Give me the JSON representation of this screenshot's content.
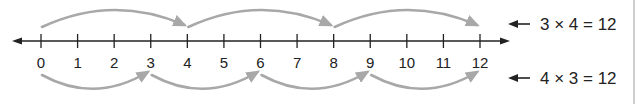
{
  "number_line": {
    "min": 0,
    "max": 12,
    "ticks": [
      0,
      1,
      2,
      3,
      4,
      5,
      6,
      7,
      8,
      9,
      10,
      11,
      12
    ],
    "tick_labels": [
      "0",
      "1",
      "2",
      "3",
      "4",
      "5",
      "6",
      "7",
      "8",
      "9",
      "10",
      "11",
      "12"
    ],
    "line_color": "#222222"
  },
  "jumps": {
    "top": {
      "jump_size": 4,
      "points": [
        0,
        4,
        8,
        12
      ],
      "equation": "3 × 4 = 12",
      "color": "#a8a8a8"
    },
    "bottom": {
      "jump_size": 3,
      "points": [
        0,
        3,
        6,
        9,
        12
      ],
      "equation": "4 × 3 = 12",
      "color": "#a8a8a8"
    }
  },
  "pointer_arrow_icon": "left-arrow-icon"
}
